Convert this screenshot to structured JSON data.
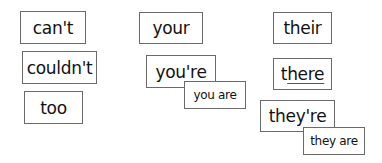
{
  "columns": [
    {
      "cards": [
        {
          "text": "can't"
        },
        {
          "text": "couldn't"
        },
        {
          "text": "too"
        }
      ]
    },
    {
      "cards": [
        {
          "text": "your"
        },
        {
          "text": "you're",
          "expansion": "you are"
        }
      ]
    },
    {
      "cards": [
        {
          "text": "their"
        },
        {
          "text_prefix": "t",
          "text_underlined": "here"
        },
        {
          "text": "they're",
          "expansion": "they are"
        }
      ]
    }
  ]
}
